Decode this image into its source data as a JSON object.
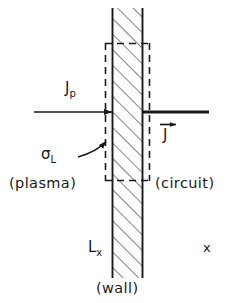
{
  "figure": {
    "type": "physics-schematic",
    "background_color": "#ffffff",
    "ink_color": "#1a1a1a",
    "axis_color_left": "#4a4a33",
    "axis_color_right": "#3a3ab0"
  },
  "labels": {
    "plasma": "(plasma)",
    "circuit": "(circuit)",
    "wall": "(wall)",
    "current_plasma": "J",
    "current_plasma_sub": "p",
    "current_circuit": "J",
    "surface_charge": "σ",
    "surface_charge_sub": "L",
    "wall_position": "L",
    "wall_position_sub": "x",
    "axis": "x"
  },
  "geometry": {
    "wall_left_x": 112,
    "wall_right_x": 143,
    "wall_top_y": 8,
    "wall_bottom_y": 278,
    "dashed_box": {
      "left_x": 105,
      "right_x": 150,
      "top_y": 43,
      "bottom_y": 181
    },
    "axis_y": 234,
    "axis_start_x": 28,
    "axis_end_x": 220,
    "jp_arrow_y": 112,
    "jp_arrow_start_x": 34,
    "j_arrow_y": 112,
    "j_arrow_end_x": 209,
    "sigma_arrow_tip_y": 141
  },
  "annotations": {
    "hatch_direction": "diagonal-down-right",
    "jp_arrow": "arrow pointing right into the wall from the plasma side",
    "j_arrow": "thick line from wall right edge extending right into the circuit",
    "j_vector_accent": "right-pointing arrow above J denoting a vector",
    "sigma_arrow": "curved arrow from sigma-L pointing to wall left surface",
    "dashed_box_meaning": "control volume / Gaussian pillbox enclosing the wall"
  }
}
